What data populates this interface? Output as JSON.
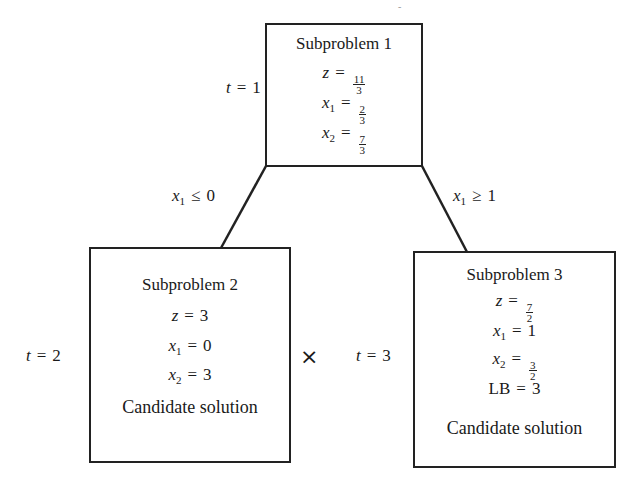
{
  "diagram": {
    "type": "branch-and-bound tree",
    "nodes": [
      {
        "id": "sub1",
        "title": "Subproblem 1",
        "t_label": "t",
        "t_value": "1",
        "z_num": "11",
        "z_den": "3",
        "x1_num": "2",
        "x1_den": "3",
        "x2_num": "7",
        "x2_den": "3"
      },
      {
        "id": "sub2",
        "title": "Subproblem 2",
        "t_label": "t",
        "t_value": "2",
        "z": "3",
        "x1": "0",
        "x2": "3",
        "status": "Candidate solution",
        "marker": "×"
      },
      {
        "id": "sub3",
        "title": "Subproblem 3",
        "t_label": "t",
        "t_value": "3",
        "z_num": "7",
        "z_den": "2",
        "x1": "1",
        "x2_num": "3",
        "x2_den": "2",
        "lb_label": "LB",
        "lb": "3",
        "status": "Candidate solution"
      }
    ],
    "edges": [
      {
        "from": "sub1",
        "to": "sub2",
        "var": "x",
        "sub": "1",
        "op": "≤",
        "value": "0"
      },
      {
        "from": "sub1",
        "to": "sub3",
        "var": "x",
        "sub": "1",
        "op": "≥",
        "value": "1"
      }
    ],
    "symbols": {
      "eq": "=",
      "z": "z",
      "x": "x",
      "one": "1",
      "two": "2"
    }
  }
}
